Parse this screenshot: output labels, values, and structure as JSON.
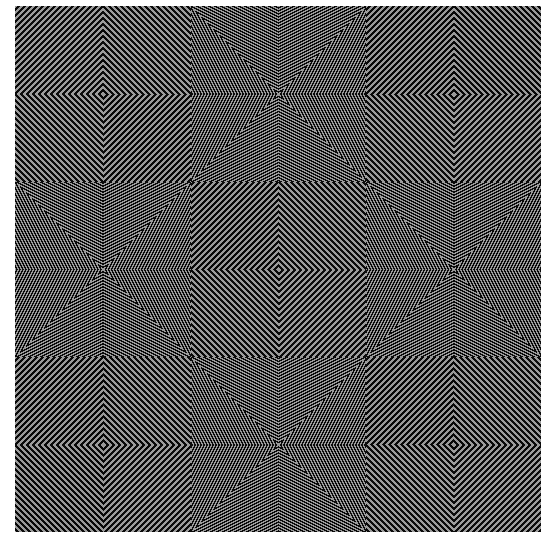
{
  "artwork": {
    "type": "op-art concentric diamond / chevron line pattern",
    "grid": 3,
    "stripe_period_px": 6,
    "colors": {
      "background": "#ffffff",
      "dark": "#0a0a0a",
      "light": "#9a9a9a"
    }
  }
}
